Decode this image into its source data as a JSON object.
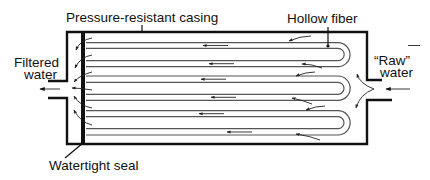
{
  "diagram": {
    "labels": {
      "casing": "Pressure-resistant casing",
      "fiber": "Hollow fiber",
      "filtered_line1": "Filtered",
      "filtered_line2": "water",
      "raw_line1": "“Raw”",
      "raw_line2": "water",
      "seal": "Watertight seal"
    },
    "components": [
      {
        "id": "casing",
        "type": "rectangular housing with inlet on right and outlet on left"
      },
      {
        "id": "seal",
        "type": "thick vertical bar near left end"
      },
      {
        "id": "fibers",
        "type": "three U-shaped hollow fiber loops",
        "count": 3
      }
    ],
    "flows": [
      {
        "from": "Raw water (right inlet)",
        "to": "fiber loops",
        "direction": "right-to-left"
      },
      {
        "from": "fiber interior",
        "to": "Filtered water (left outlet)",
        "direction": "right-to-left"
      }
    ],
    "colors": {
      "line": "#111111",
      "fiber": "#555555",
      "background": "#ffffff"
    }
  }
}
